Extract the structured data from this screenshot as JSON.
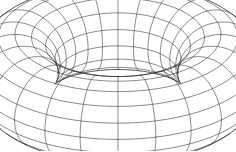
{
  "figure": {
    "kind": "3d-wireframe-surface",
    "shape": "torus",
    "background_color": "#ffffff",
    "line_color": "#3a3a3a",
    "silhouette_color": "#2a2a2a",
    "line_width": 0.6,
    "canvas": {
      "width": 236,
      "height": 151
    }
  },
  "geometry": {
    "major_radius": 1.0,
    "minor_radius": 0.42,
    "meridian_count": 24,
    "tube_count": 16,
    "projection": "orthographic",
    "elevation_degrees": 27,
    "azimuth_degrees": 0,
    "center_x": 118,
    "center_y": 73,
    "scale_x": 103,
    "scale_y": 103,
    "outer_extent_x": [
      12,
      224
    ],
    "outer_extent_y": [
      8,
      143
    ],
    "hole_extent_x": [
      88,
      150
    ],
    "hole_extent_y": [
      40,
      72
    ]
  },
  "labels": {
    "caption": "",
    "axis_labels": [],
    "annotations": []
  }
}
